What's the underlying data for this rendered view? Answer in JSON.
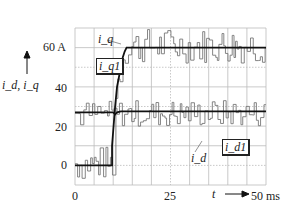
{
  "chart_data": {
    "type": "line",
    "title": "",
    "xlabel": "t",
    "ylabel": "i_d, i_q",
    "x_unit": "ms",
    "y_unit": "A",
    "xlim": [
      0,
      50
    ],
    "ylim": [
      -10,
      70
    ],
    "x_ticks": [
      {
        "value": 0,
        "label": "0"
      },
      {
        "value": 25,
        "label": "25"
      },
      {
        "value": 50,
        "label": "50 ms"
      }
    ],
    "y_ticks": [
      {
        "value": 0,
        "label": "0"
      },
      {
        "value": 20,
        "label": "20"
      },
      {
        "value": 40,
        "label": "40"
      },
      {
        "value": 60,
        "label": "60 A"
      }
    ],
    "grid": {
      "x_step": 5,
      "y_step": 10,
      "on": true
    },
    "series": [
      {
        "name": "i_q1",
        "kind": "reference",
        "style": "thick black step",
        "x": [
          0,
          9.7,
          9.7,
          10.5,
          11,
          11.5,
          12,
          12.5,
          13,
          13.5,
          50
        ],
        "y": [
          0,
          0,
          10,
          30,
          40,
          45,
          50,
          55,
          58,
          60,
          60
        ]
      },
      {
        "name": "i_d1",
        "kind": "reference",
        "style": "thick black",
        "x": [
          0,
          10,
          10.5,
          11,
          12,
          13,
          50
        ],
        "y": [
          27,
          27,
          26,
          27,
          27.5,
          27.5,
          27.5
        ]
      },
      {
        "name": "i_q",
        "kind": "measured",
        "style": "thin gray noisy",
        "note": "noisy around 0 before t≈10 ms, rises to ≈60 A with ±10 A ripple"
      },
      {
        "name": "i_d",
        "kind": "measured",
        "style": "thin gray noisy",
        "note": "noisy around ≈27 A with ±8 A ripple throughout"
      }
    ],
    "annotations": [
      {
        "text": "i_q",
        "target": "measured q-current",
        "x": 7,
        "y": 63
      },
      {
        "text": "i_q1",
        "target": "q-current reference (boxed)",
        "x": 6,
        "y": 53
      },
      {
        "text": "i_d",
        "target": "measured d-current",
        "x": 29,
        "y": 17
      },
      {
        "text": "i_d1",
        "target": "d-current reference (boxed)",
        "x": 37,
        "y": 19
      }
    ]
  },
  "labels": {
    "y_axis": "i_d, i_q",
    "x_axis": "t",
    "y60": "60 A",
    "y40": "40",
    "y20": "20",
    "y0": "0",
    "x0": "0",
    "x25": "25",
    "x50": "50 ms",
    "iq": "i_q",
    "iq1": "i_q1",
    "id": "i_d",
    "id1": "i_d1"
  }
}
